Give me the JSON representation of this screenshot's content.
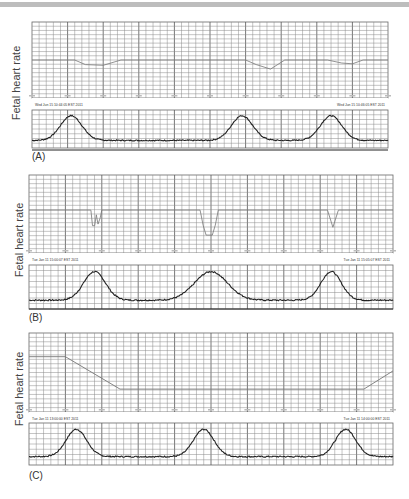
{
  "figure": {
    "y_axis_label": "Fetal heart rate",
    "colors": {
      "grid": "#8a8a8a",
      "grid_major": "#555555",
      "fhr_trace": "#777777",
      "uc_trace": "#222222",
      "strip": "#ffffff",
      "top_band": "#bdbdbd"
    }
  },
  "panels": [
    {
      "label": "(A)",
      "pattern": "early decelerations",
      "timestamp_left": "Wed Jun 15 10:44:05 EST 2011",
      "timestamp_right": "Wed Jun 15 10:46:05 EST 2011"
    },
    {
      "label": "(B)",
      "pattern": "variable decelerations",
      "timestamp_left": "Tue Jan 11 15:00:07 EST 2011",
      "timestamp_right": "Tue Jan 11 15:05:07 EST 2011"
    },
    {
      "label": "(C)",
      "pattern": "prolonged deceleration",
      "timestamp_left": "Tue Jan 11 13:00:00 EST 2011",
      "timestamp_right": "Tue Jan 11 14:00:00 EST 2011"
    }
  ],
  "chart_data": [
    {
      "type": "line",
      "title": "(A)",
      "ylabel": "Fetal heart rate",
      "grid": true,
      "series": [
        {
          "name": "Fetal heart rate",
          "x": [
            0,
            0.12,
            0.15,
            0.2,
            0.25,
            0.6,
            0.63,
            0.67,
            0.71,
            0.83,
            0.87,
            0.9,
            0.93,
            1.0
          ],
          "y": [
            0.5,
            0.5,
            0.44,
            0.43,
            0.5,
            0.5,
            0.44,
            0.38,
            0.5,
            0.5,
            0.46,
            0.45,
            0.5,
            0.5
          ]
        },
        {
          "name": "Uterine contractions",
          "peaks_x": [
            0.11,
            0.59,
            0.84
          ],
          "baseline": 0.2,
          "peak": 0.85
        }
      ]
    },
    {
      "type": "line",
      "title": "(B)",
      "ylabel": "Fetal heart rate",
      "grid": true,
      "series": [
        {
          "name": "Fetal heart rate",
          "baseline": 0.55,
          "dips": [
            {
              "x_start": 0.17,
              "x_end": 0.2,
              "shape": "W",
              "depth": 0.2
            },
            {
              "x_start": 0.47,
              "x_end": 0.52,
              "shape": "U",
              "depth": 0.32
            },
            {
              "x_start": 0.82,
              "x_end": 0.85,
              "shape": "V",
              "depth": 0.22
            }
          ]
        },
        {
          "name": "Uterine contractions",
          "peaks_x": [
            0.18,
            0.5,
            0.83
          ],
          "baseline": 0.2,
          "peak": 0.85
        }
      ]
    },
    {
      "type": "line",
      "title": "(C)",
      "ylabel": "Fetal heart rate",
      "grid": true,
      "series": [
        {
          "name": "Fetal heart rate",
          "x": [
            0,
            0.1,
            0.25,
            0.92,
            1.0
          ],
          "y": [
            0.7,
            0.7,
            0.29,
            0.29,
            0.52
          ]
        },
        {
          "name": "Uterine contractions",
          "peaks_x": [
            0.13,
            0.48,
            0.87
          ],
          "baseline": 0.2,
          "peak": 0.85
        }
      ]
    }
  ]
}
